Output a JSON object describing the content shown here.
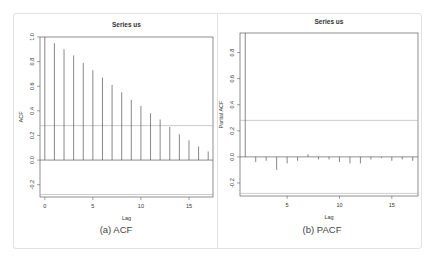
{
  "chart_data": [
    {
      "type": "bar",
      "subtype": "acf-stem",
      "title": "Series us",
      "caption": "(a) ACF",
      "xlabel": "Lag",
      "ylabel": "ACF",
      "x": [
        0,
        1,
        2,
        3,
        4,
        5,
        6,
        7,
        8,
        9,
        10,
        11,
        12,
        13,
        14,
        15,
        16,
        17
      ],
      "values": [
        1.0,
        0.95,
        0.9,
        0.85,
        0.79,
        0.73,
        0.67,
        0.61,
        0.55,
        0.49,
        0.44,
        0.38,
        0.33,
        0.27,
        0.21,
        0.16,
        0.11,
        0.07
      ],
      "conf_bound": 0.28,
      "xticks": [
        "0",
        "5",
        "10",
        "15"
      ],
      "yticks": [
        "-0.2",
        "0.0",
        "0.2",
        "0.4",
        "0.6",
        "0.8",
        "1.0"
      ],
      "ylim": [
        -0.3,
        1.0
      ],
      "xlim": [
        -0.5,
        17.5
      ],
      "grid": false
    },
    {
      "type": "bar",
      "subtype": "pacf-stem",
      "title": "Series us",
      "caption": "(b) PACF",
      "xlabel": "Lag",
      "ylabel": "Partial ACF",
      "x": [
        1,
        2,
        3,
        4,
        5,
        6,
        7,
        8,
        9,
        10,
        11,
        12,
        13,
        14,
        15,
        16,
        17
      ],
      "values": [
        0.95,
        -0.04,
        -0.03,
        -0.1,
        -0.05,
        -0.03,
        0.02,
        -0.02,
        -0.02,
        -0.04,
        -0.05,
        -0.05,
        -0.02,
        -0.01,
        -0.03,
        -0.02,
        -0.03
      ],
      "conf_bound": 0.28,
      "xticks": [
        "5",
        "10",
        "15"
      ],
      "yticks": [
        "-0.2",
        "0.0",
        "0.2",
        "0.4",
        "0.6",
        "0.8"
      ],
      "ylim": [
        -0.3,
        0.95
      ],
      "xlim": [
        0.5,
        17.5
      ],
      "grid": false
    }
  ],
  "colors": {
    "stem": "#555555",
    "bound": "#aaaaaa",
    "frame": "#444444",
    "text": "#333333"
  }
}
